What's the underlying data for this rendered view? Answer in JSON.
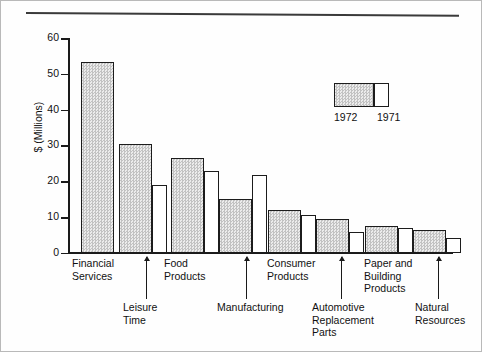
{
  "chart_data": {
    "type": "bar",
    "title": "",
    "subtitle": "",
    "xlabel": "",
    "ylabel": "$ (Millions)",
    "ylim": [
      0,
      60
    ],
    "yticks": [
      0,
      10,
      20,
      30,
      40,
      50,
      60
    ],
    "grid": false,
    "legend_position": "upper-right",
    "categories": [
      "Financial\nServices",
      "Leisure\nTime",
      "Food\nProducts",
      "Manufacturing",
      "Consumer\nProducts",
      "Automotive\nReplacement\nParts",
      "Paper and\nBuilding\nProducts",
      "Natural\nResources"
    ],
    "series": [
      {
        "name": "1972",
        "color": "#d4d4d4",
        "values": [
          53.2,
          30.5,
          26.6,
          15.0,
          12.1,
          9.6,
          7.6,
          6.3
        ]
      },
      {
        "name": "1971",
        "color": "#ffffff",
        "values": [
          null,
          19.0,
          23.0,
          21.8,
          10.5,
          6.0,
          7.0,
          4.2
        ]
      }
    ]
  },
  "legend": {
    "entry_1972": "1972",
    "entry_1971": "1971"
  },
  "axis": {
    "y_title": "$ (Millions)",
    "y_tick_60": "60",
    "y_tick_50": "50",
    "y_tick_40": "40",
    "y_tick_30": "30",
    "y_tick_20": "20",
    "y_tick_10": "10",
    "y_tick_0": "0"
  },
  "categories": {
    "financial_services": "Financial\nServices",
    "leisure_time": "Leisure\nTime",
    "food_products": "Food\nProducts",
    "manufacturing": "Manufacturing",
    "consumer_products": "Consumer\nProducts",
    "automotive_replacement_parts": "Automotive\nReplacement\nParts",
    "paper_and_building_products": "Paper and\nBuilding\nProducts",
    "natural_resources": "Natural\nResources"
  }
}
